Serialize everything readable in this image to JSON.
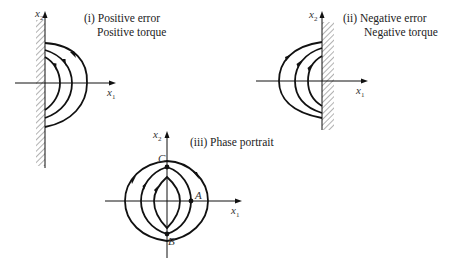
{
  "panels": [
    {
      "id": "i",
      "title_line1": "(i) Positive error",
      "title_line2": "Positive torque",
      "x_axis_label": "x",
      "x_axis_sub": "1",
      "y_axis_label": "x",
      "y_axis_sub": "2",
      "wall_side": "left",
      "trajectories": 3
    },
    {
      "id": "ii",
      "title_line1": "(ii)  Negative error",
      "title_line2": "Negative torque",
      "x_axis_label": "x",
      "x_axis_sub": "1",
      "y_axis_label": "x",
      "y_axis_sub": "2",
      "wall_side": "right",
      "trajectories": 3
    },
    {
      "id": "iii",
      "title_line1": "(iii)  Phase portrait",
      "x_axis_label": "x",
      "x_axis_sub": "1",
      "y_axis_label": "x",
      "y_axis_sub": "2",
      "points": {
        "A": "A",
        "B": "B",
        "C": "C"
      },
      "trajectories": 3
    }
  ],
  "colors": {
    "stroke": "#111111",
    "hatch": "#555555",
    "background": "#ffffff"
  }
}
